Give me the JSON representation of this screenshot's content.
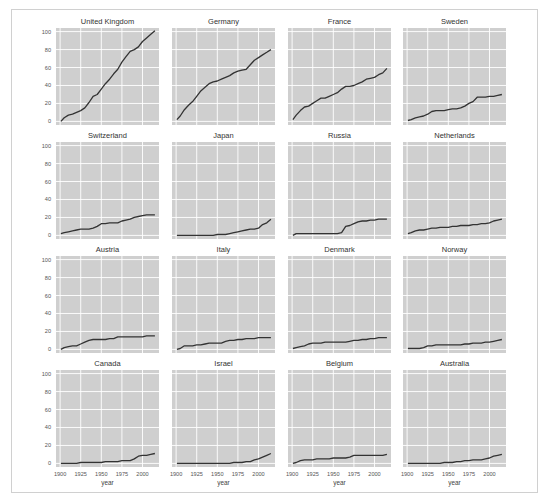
{
  "chart_data": {
    "type": "line",
    "title": "",
    "layout": {
      "rows": 4,
      "cols": 4,
      "sharex": true,
      "sharey": true,
      "grid": true,
      "style": "ggplot-like gray background with white gridlines"
    },
    "xlabel": "year",
    "ylabel": "",
    "xlim": [
      1895,
      2020
    ],
    "ylim": [
      -4,
      104
    ],
    "xticks": [
      1900,
      1925,
      1950,
      1975,
      2000
    ],
    "yticks": [
      0,
      20,
      40,
      60,
      80,
      100
    ],
    "line_color": "#333333",
    "axes_bg": "#cfcfcf",
    "grid_color": "#ffffff",
    "panels": [
      {
        "title": "United Kingdom",
        "x": [
          1901,
          1905,
          1910,
          1915,
          1920,
          1925,
          1930,
          1935,
          1940,
          1945,
          1950,
          1955,
          1960,
          1965,
          1970,
          1975,
          1980,
          1985,
          1990,
          1995,
          2000,
          2005,
          2010,
          2015
        ],
        "values": [
          0,
          4,
          7,
          8,
          10,
          12,
          15,
          21,
          28,
          30,
          36,
          42,
          47,
          53,
          58,
          66,
          72,
          78,
          80,
          83,
          89,
          93,
          97,
          101
        ]
      },
      {
        "title": "Germany",
        "x": [
          1901,
          1905,
          1910,
          1915,
          1920,
          1925,
          1930,
          1935,
          1940,
          1945,
          1950,
          1955,
          1960,
          1965,
          1970,
          1975,
          1980,
          1985,
          1990,
          1995,
          2000,
          2005,
          2010,
          2015
        ],
        "values": [
          2,
          6,
          13,
          18,
          22,
          28,
          34,
          38,
          42,
          44,
          45,
          47,
          49,
          51,
          54,
          56,
          57,
          58,
          63,
          68,
          71,
          74,
          77,
          80
        ]
      },
      {
        "title": "France",
        "x": [
          1901,
          1905,
          1910,
          1915,
          1920,
          1925,
          1930,
          1935,
          1940,
          1945,
          1950,
          1955,
          1960,
          1965,
          1970,
          1975,
          1980,
          1985,
          1990,
          1995,
          2000,
          2005,
          2010,
          2015
        ],
        "values": [
          2,
          7,
          12,
          16,
          17,
          20,
          23,
          26,
          26,
          28,
          30,
          32,
          36,
          39,
          39,
          40,
          42,
          44,
          47,
          48,
          49,
          52,
          54,
          59
        ]
      },
      {
        "title": "Sweden",
        "x": [
          1901,
          1905,
          1910,
          1915,
          1920,
          1925,
          1930,
          1935,
          1940,
          1945,
          1950,
          1955,
          1960,
          1965,
          1970,
          1975,
          1980,
          1985,
          1990,
          1995,
          2000,
          2005,
          2010,
          2015
        ],
        "values": [
          1,
          2,
          4,
          5,
          6,
          8,
          11,
          12,
          12,
          12,
          13,
          14,
          14,
          15,
          17,
          20,
          22,
          27,
          27,
          27,
          28,
          28,
          29,
          30
        ]
      },
      {
        "title": "Switzerland",
        "x": [
          1901,
          1905,
          1910,
          1915,
          1920,
          1925,
          1930,
          1935,
          1940,
          1945,
          1950,
          1955,
          1960,
          1965,
          1970,
          1975,
          1980,
          1985,
          1990,
          1995,
          2000,
          2005,
          2010,
          2015
        ],
        "values": [
          2,
          3,
          4,
          5,
          6,
          7,
          7,
          7,
          8,
          10,
          13,
          13,
          14,
          14,
          14,
          16,
          17,
          18,
          20,
          21,
          22,
          23,
          23,
          23
        ]
      },
      {
        "title": "Japan",
        "x": [
          1901,
          1905,
          1910,
          1915,
          1920,
          1925,
          1930,
          1935,
          1940,
          1945,
          1950,
          1955,
          1960,
          1965,
          1970,
          1975,
          1980,
          1985,
          1990,
          1995,
          2000,
          2005,
          2010,
          2015
        ],
        "values": [
          0,
          0,
          0,
          0,
          0,
          0,
          0,
          0,
          0,
          0,
          1,
          1,
          1,
          2,
          3,
          4,
          5,
          6,
          7,
          7,
          8,
          12,
          14,
          18
        ]
      },
      {
        "title": "Russia",
        "x": [
          1901,
          1905,
          1910,
          1915,
          1920,
          1925,
          1930,
          1935,
          1940,
          1945,
          1950,
          1955,
          1960,
          1965,
          1970,
          1975,
          1980,
          1985,
          1990,
          1995,
          2000,
          2005,
          2010,
          2015
        ],
        "values": [
          0,
          2,
          2,
          2,
          2,
          2,
          2,
          2,
          2,
          2,
          2,
          2,
          3,
          10,
          11,
          13,
          15,
          16,
          16,
          17,
          17,
          18,
          18,
          18
        ]
      },
      {
        "title": "Netherlands",
        "x": [
          1901,
          1905,
          1910,
          1915,
          1920,
          1925,
          1930,
          1935,
          1940,
          1945,
          1950,
          1955,
          1960,
          1965,
          1970,
          1975,
          1980,
          1985,
          1990,
          1995,
          2000,
          2005,
          2010,
          2015
        ],
        "values": [
          2,
          3,
          5,
          6,
          6,
          7,
          8,
          8,
          9,
          9,
          9,
          10,
          10,
          11,
          11,
          11,
          12,
          12,
          13,
          13,
          14,
          16,
          17,
          18
        ]
      },
      {
        "title": "Austria",
        "x": [
          1901,
          1905,
          1910,
          1915,
          1920,
          1925,
          1930,
          1935,
          1940,
          1945,
          1950,
          1955,
          1960,
          1965,
          1970,
          1975,
          1980,
          1985,
          1990,
          1995,
          2000,
          2005,
          2010,
          2015
        ],
        "values": [
          0,
          2,
          3,
          4,
          4,
          6,
          8,
          10,
          11,
          11,
          11,
          11,
          12,
          12,
          14,
          14,
          14,
          14,
          14,
          14,
          14,
          15,
          15,
          15
        ]
      },
      {
        "title": "Italy",
        "x": [
          1901,
          1905,
          1910,
          1915,
          1920,
          1925,
          1930,
          1935,
          1940,
          1945,
          1950,
          1955,
          1960,
          1965,
          1970,
          1975,
          1980,
          1985,
          1990,
          1995,
          2000,
          2005,
          2010,
          2015
        ],
        "values": [
          0,
          1,
          4,
          4,
          4,
          5,
          5,
          6,
          7,
          7,
          7,
          7,
          9,
          10,
          10,
          11,
          11,
          12,
          12,
          12,
          13,
          13,
          13,
          13
        ]
      },
      {
        "title": "Denmark",
        "x": [
          1901,
          1905,
          1910,
          1915,
          1920,
          1925,
          1930,
          1935,
          1940,
          1945,
          1950,
          1955,
          1960,
          1965,
          1970,
          1975,
          1980,
          1985,
          1990,
          1995,
          2000,
          2005,
          2010,
          2015
        ],
        "values": [
          1,
          2,
          3,
          4,
          6,
          7,
          7,
          7,
          8,
          8,
          8,
          8,
          8,
          8,
          9,
          10,
          10,
          11,
          11,
          12,
          12,
          13,
          13,
          13
        ]
      },
      {
        "title": "Norway",
        "x": [
          1901,
          1905,
          1910,
          1915,
          1920,
          1925,
          1930,
          1935,
          1940,
          1945,
          1950,
          1955,
          1960,
          1965,
          1970,
          1975,
          1980,
          1985,
          1990,
          1995,
          2000,
          2005,
          2010,
          2015
        ],
        "values": [
          1,
          1,
          1,
          1,
          2,
          4,
          4,
          5,
          5,
          5,
          5,
          5,
          5,
          5,
          6,
          6,
          7,
          7,
          7,
          8,
          8,
          9,
          10,
          11
        ]
      },
      {
        "title": "Canada",
        "x": [
          1901,
          1905,
          1910,
          1915,
          1920,
          1925,
          1930,
          1935,
          1940,
          1945,
          1950,
          1955,
          1960,
          1965,
          1970,
          1975,
          1980,
          1985,
          1990,
          1995,
          2000,
          2005,
          2010,
          2015
        ],
        "values": [
          0,
          0,
          0,
          0,
          0,
          1,
          1,
          1,
          1,
          1,
          1,
          2,
          2,
          2,
          2,
          3,
          3,
          3,
          5,
          8,
          9,
          9,
          10,
          11
        ]
      },
      {
        "title": "Israel",
        "x": [
          1901,
          1905,
          1910,
          1915,
          1920,
          1925,
          1930,
          1935,
          1940,
          1945,
          1950,
          1955,
          1960,
          1965,
          1970,
          1975,
          1980,
          1985,
          1990,
          1995,
          2000,
          2005,
          2010,
          2015
        ],
        "values": [
          0,
          0,
          0,
          0,
          0,
          0,
          0,
          0,
          0,
          0,
          0,
          0,
          0,
          0,
          1,
          1,
          1,
          2,
          2,
          4,
          5,
          7,
          9,
          11
        ]
      },
      {
        "title": "Belgium",
        "x": [
          1901,
          1905,
          1910,
          1915,
          1920,
          1925,
          1930,
          1935,
          1940,
          1945,
          1950,
          1955,
          1960,
          1965,
          1970,
          1975,
          1980,
          1985,
          1990,
          1995,
          2000,
          2005,
          2010,
          2015
        ],
        "values": [
          0,
          1,
          3,
          4,
          4,
          4,
          5,
          5,
          5,
          5,
          6,
          6,
          6,
          6,
          7,
          9,
          9,
          9,
          9,
          9,
          9,
          9,
          9,
          10
        ]
      },
      {
        "title": "Australia",
        "x": [
          1901,
          1905,
          1910,
          1915,
          1920,
          1925,
          1930,
          1935,
          1940,
          1945,
          1950,
          1955,
          1960,
          1965,
          1970,
          1975,
          1980,
          1985,
          1990,
          1995,
          2000,
          2005,
          2010,
          2015
        ],
        "values": [
          0,
          0,
          0,
          0,
          0,
          0,
          0,
          0,
          0,
          1,
          1,
          1,
          2,
          2,
          3,
          3,
          4,
          4,
          4,
          5,
          6,
          8,
          9,
          10
        ]
      }
    ]
  }
}
